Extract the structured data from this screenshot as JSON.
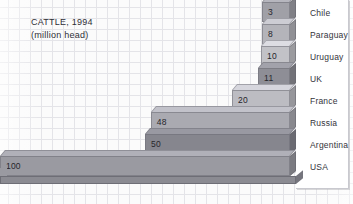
{
  "chart_data": {
    "type": "bar",
    "orientation": "horizontal",
    "title": "CATTLE, 1994",
    "subtitle": "(million head)",
    "xlabel": "",
    "ylabel": "",
    "xlim": [
      0,
      100
    ],
    "grid": true,
    "legend": "none",
    "unit": "million head",
    "categories": [
      "Chile",
      "Paraguay",
      "Uruguay",
      "UK",
      "France",
      "Russia",
      "Argentina",
      "USA"
    ],
    "values": [
      3,
      8,
      10,
      11,
      20,
      48,
      50,
      100
    ],
    "value_labels": [
      "3",
      "8",
      "10",
      "11",
      "20",
      "48",
      "50",
      "100"
    ],
    "bars": [
      {
        "label": "Chile",
        "value": 3,
        "value_label": "3",
        "color": "#a0a0a7"
      },
      {
        "label": "Paraguay",
        "value": 8,
        "value_label": "8",
        "color": "#b4b4ba"
      },
      {
        "label": "Uruguay",
        "value": 10,
        "value_label": "10",
        "color": "#c2c2c7"
      },
      {
        "label": "UK",
        "value": 11,
        "value_label": "11",
        "color": "#8e8e96"
      },
      {
        "label": "France",
        "value": 20,
        "value_label": "20",
        "color": "#bcbcc2"
      },
      {
        "label": "Russia",
        "value": 48,
        "value_label": "48",
        "color": "#aaaab1"
      },
      {
        "label": "Argentina",
        "value": 50,
        "value_label": "50",
        "color": "#86868e"
      },
      {
        "label": "USA",
        "value": 100,
        "value_label": "100",
        "color": "#9a9aa1"
      }
    ],
    "colors": {
      "background": "#fbfbfb",
      "grid_line": "#e4e4e8",
      "text": "#33333a",
      "panel": "#ffffff",
      "panel_border": "#c9c9cf",
      "base": "#8b8b92"
    }
  }
}
